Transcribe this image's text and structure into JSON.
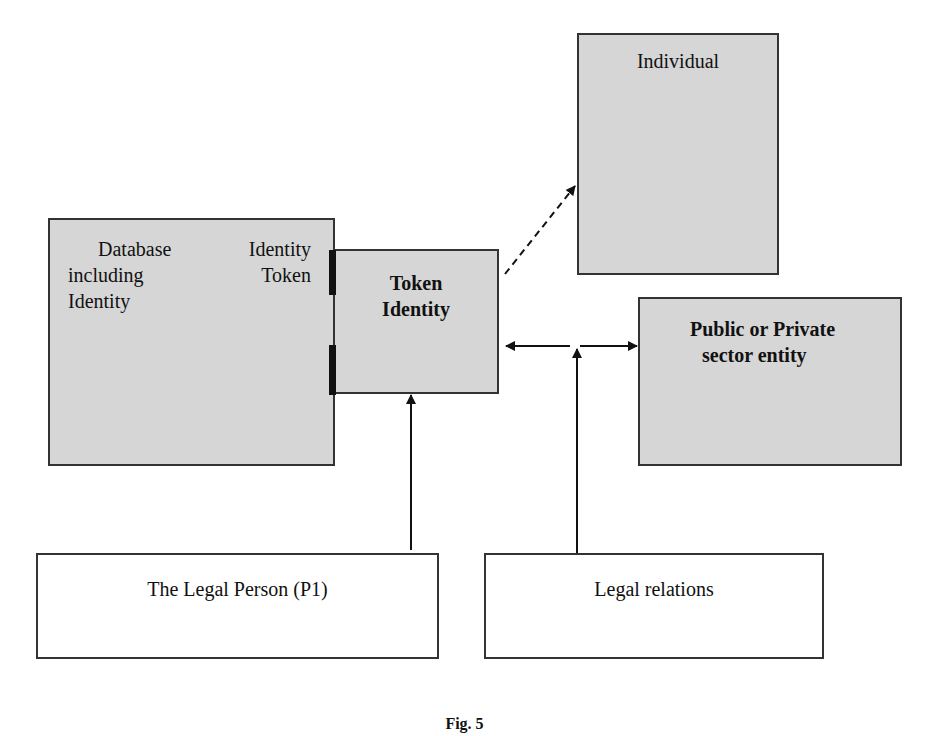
{
  "nodes": {
    "individual": {
      "label": "Individual"
    },
    "database": {
      "line1_left": "Database",
      "line1_right": "Identity",
      "line2_left": "including",
      "line2_right": "Token",
      "line3": "Identity"
    },
    "token": {
      "line1": "Token",
      "line2": "Identity"
    },
    "entity": {
      "line1": "Public or Private",
      "line2": "sector entity"
    },
    "legal_person": {
      "label": "The Legal Person (P1)"
    },
    "legal_relations": {
      "label": "Legal relations"
    }
  },
  "caption": "Fig. 5",
  "colors": {
    "box_fill": "#d6d6d6",
    "border": "#333333"
  }
}
